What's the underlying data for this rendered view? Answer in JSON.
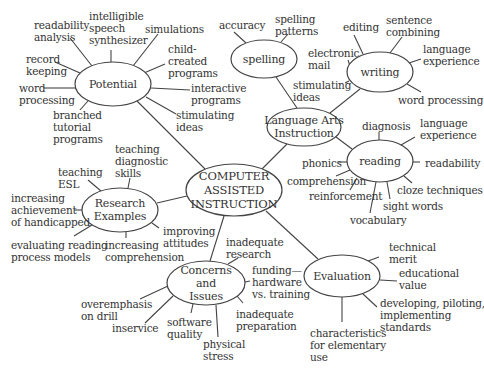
{
  "diagram": {
    "stroke_color": "#444444",
    "text_color": "#333333",
    "center": {
      "label": "COMPUTER\nASSISTED\nINSTRUCTION",
      "cx": 234,
      "cy": 190,
      "rx": 48,
      "ry": 26
    },
    "nodes": [
      {
        "id": "potential",
        "label": "Potential",
        "cx": 113,
        "cy": 84,
        "rx": 38,
        "ry": 22
      },
      {
        "id": "spelling",
        "label": "spelling",
        "cx": 264,
        "cy": 59,
        "rx": 33,
        "ry": 19
      },
      {
        "id": "writing",
        "label": "writing",
        "cx": 380,
        "cy": 72,
        "rx": 33,
        "ry": 20
      },
      {
        "id": "language-arts",
        "label": "Language Arts\nInstruction",
        "cx": 304,
        "cy": 127,
        "rx": 37,
        "ry": 19
      },
      {
        "id": "reading",
        "label": "reading",
        "cx": 380,
        "cy": 161,
        "rx": 33,
        "ry": 21
      },
      {
        "id": "research",
        "label": "Research\nExamples",
        "cx": 120,
        "cy": 210,
        "rx": 38,
        "ry": 22
      },
      {
        "id": "concerns",
        "label": "Concerns\nand\nIssues",
        "cx": 206,
        "cy": 283,
        "rx": 39,
        "ry": 22
      },
      {
        "id": "evaluation",
        "label": "Evaluation",
        "cx": 342,
        "cy": 276,
        "rx": 38,
        "ry": 21
      }
    ],
    "connectors": [
      {
        "from": "center",
        "to": "potential",
        "x1": 205,
        "y1": 169,
        "x2": 137,
        "y2": 101
      },
      {
        "from": "center",
        "to": "language-arts",
        "x1": 262,
        "y1": 169,
        "x2": 287,
        "y2": 144
      },
      {
        "from": "language-arts",
        "to": "spelling",
        "x1": 297,
        "y1": 108,
        "x2": 276,
        "y2": 77
      },
      {
        "from": "language-arts",
        "to": "writing",
        "x1": 330,
        "y1": 113,
        "x2": 360,
        "y2": 89
      },
      {
        "from": "language-arts",
        "to": "reading",
        "x1": 336,
        "y1": 137,
        "x2": 352,
        "y2": 149
      },
      {
        "from": "center",
        "to": "research",
        "x1": 187,
        "y1": 196,
        "x2": 157,
        "y2": 203
      },
      {
        "from": "center",
        "to": "concerns",
        "x1": 224,
        "y1": 216,
        "x2": 210,
        "y2": 261
      },
      {
        "from": "center",
        "to": "evaluation",
        "x1": 266,
        "y1": 211,
        "x2": 318,
        "y2": 259
      }
    ],
    "spokes": [
      {
        "x1": 92,
        "y1": 66,
        "x2": 70,
        "y2": 38
      },
      {
        "x1": 111,
        "y1": 62,
        "x2": 111,
        "y2": 50
      },
      {
        "x1": 133,
        "y1": 66,
        "x2": 158,
        "y2": 34
      },
      {
        "x1": 144,
        "y1": 73,
        "x2": 165,
        "y2": 64
      },
      {
        "x1": 151,
        "y1": 88,
        "x2": 190,
        "y2": 90
      },
      {
        "x1": 146,
        "y1": 97,
        "x2": 176,
        "y2": 114
      },
      {
        "x1": 80,
        "y1": 73,
        "x2": 55,
        "y2": 62
      },
      {
        "x1": 76,
        "y1": 88,
        "x2": 44,
        "y2": 88
      },
      {
        "x1": 88,
        "y1": 101,
        "x2": 80,
        "y2": 110
      },
      {
        "x1": 246,
        "y1": 43,
        "x2": 234,
        "y2": 32
      },
      {
        "x1": 281,
        "y1": 42,
        "x2": 288,
        "y2": 34
      },
      {
        "x1": 363,
        "y1": 54,
        "x2": 354,
        "y2": 35
      },
      {
        "x1": 390,
        "y1": 53,
        "x2": 402,
        "y2": 37
      },
      {
        "x1": 409,
        "y1": 63,
        "x2": 421,
        "y2": 59
      },
      {
        "x1": 407,
        "y1": 84,
        "x2": 421,
        "y2": 92
      },
      {
        "x1": 350,
        "y1": 66,
        "x2": 348,
        "y2": 60
      },
      {
        "x1": 349,
        "y1": 81,
        "x2": 345,
        "y2": 83
      },
      {
        "x1": 379,
        "y1": 140,
        "x2": 379,
        "y2": 132
      },
      {
        "x1": 401,
        "y1": 145,
        "x2": 415,
        "y2": 137
      },
      {
        "x1": 413,
        "y1": 162,
        "x2": 420,
        "y2": 162
      },
      {
        "x1": 404,
        "y1": 176,
        "x2": 412,
        "y2": 183
      },
      {
        "x1": 347,
        "y1": 162,
        "x2": 338,
        "y2": 162
      },
      {
        "x1": 350,
        "y1": 170,
        "x2": 336,
        "y2": 176
      },
      {
        "x1": 357,
        "y1": 178,
        "x2": 350,
        "y2": 190
      },
      {
        "x1": 376,
        "y1": 182,
        "x2": 370,
        "y2": 213
      },
      {
        "x1": 387,
        "y1": 182,
        "x2": 390,
        "y2": 199
      },
      {
        "x1": 101,
        "y1": 191,
        "x2": 88,
        "y2": 180
      },
      {
        "x1": 128,
        "y1": 188,
        "x2": 130,
        "y2": 178
      },
      {
        "x1": 82,
        "y1": 210,
        "x2": 74,
        "y2": 210
      },
      {
        "x1": 92,
        "y1": 225,
        "x2": 74,
        "y2": 236
      },
      {
        "x1": 126,
        "y1": 232,
        "x2": 126,
        "y2": 238
      },
      {
        "x1": 152,
        "y1": 223,
        "x2": 159,
        "y2": 228
      },
      {
        "x1": 228,
        "y1": 264,
        "x2": 238,
        "y2": 258
      },
      {
        "x1": 245,
        "y1": 282,
        "x2": 250,
        "y2": 281
      },
      {
        "x1": 237,
        "y1": 296,
        "x2": 243,
        "y2": 303
      },
      {
        "x1": 168,
        "y1": 286,
        "x2": 140,
        "y2": 299
      },
      {
        "x1": 173,
        "y1": 296,
        "x2": 145,
        "y2": 323
      },
      {
        "x1": 193,
        "y1": 304,
        "x2": 191,
        "y2": 313
      },
      {
        "x1": 216,
        "y1": 305,
        "x2": 218,
        "y2": 337
      },
      {
        "x1": 368,
        "y1": 261,
        "x2": 379,
        "y2": 257
      },
      {
        "x1": 380,
        "y1": 280,
        "x2": 397,
        "y2": 281
      },
      {
        "x1": 363,
        "y1": 294,
        "x2": 377,
        "y2": 307
      },
      {
        "x1": 342,
        "y1": 297,
        "x2": 342,
        "y2": 322
      }
    ],
    "leaf_labels": [
      {
        "node": "potential",
        "text": "readability\nanalysis",
        "x": 34,
        "y": 19
      },
      {
        "node": "potential",
        "text": "intelligible\nspeech\nsynthesizer",
        "x": 89,
        "y": 10
      },
      {
        "node": "potential",
        "text": "simulations",
        "x": 145,
        "y": 23
      },
      {
        "node": "potential",
        "text": "child-\ncreated\nprograms",
        "x": 168,
        "y": 43
      },
      {
        "node": "potential",
        "text": "record\nkeeping",
        "x": 26,
        "y": 53
      },
      {
        "node": "potential",
        "text": "word\nprocessing",
        "x": 19,
        "y": 82
      },
      {
        "node": "potential",
        "text": "interactive\nprograms",
        "x": 191,
        "y": 82
      },
      {
        "node": "potential",
        "text": "branched\ntutorial\nprograms",
        "x": 53,
        "y": 109
      },
      {
        "node": "potential",
        "text": "stimulating\nideas",
        "x": 176,
        "y": 109
      },
      {
        "node": "spelling",
        "text": "accuracy",
        "x": 219,
        "y": 19
      },
      {
        "node": "spelling",
        "text": "spelling\npatterns",
        "x": 275,
        "y": 13
      },
      {
        "node": "writing",
        "text": "editing",
        "x": 343,
        "y": 21
      },
      {
        "node": "writing",
        "text": "sentence\ncombining",
        "x": 386,
        "y": 14
      },
      {
        "node": "writing",
        "text": "language\nexperience",
        "x": 423,
        "y": 43
      },
      {
        "node": "writing",
        "text": "electronic\nmail",
        "x": 308,
        "y": 47
      },
      {
        "node": "writing",
        "text": "stimulating\nideas",
        "x": 293,
        "y": 79
      },
      {
        "node": "writing",
        "text": "word processing",
        "x": 398,
        "y": 94
      },
      {
        "node": "reading",
        "text": "diagnosis",
        "x": 362,
        "y": 120
      },
      {
        "node": "reading",
        "text": "language\nexperience",
        "x": 420,
        "y": 117
      },
      {
        "node": "reading",
        "text": "phonics",
        "x": 302,
        "y": 157
      },
      {
        "node": "reading",
        "text": "readability",
        "x": 425,
        "y": 157
      },
      {
        "node": "reading",
        "text": "comprehension",
        "x": 287,
        "y": 175
      },
      {
        "node": "reading",
        "text": "reinforcement",
        "x": 309,
        "y": 190
      },
      {
        "node": "reading",
        "text": "cloze techniques",
        "x": 397,
        "y": 184
      },
      {
        "node": "reading",
        "text": "sight words",
        "x": 383,
        "y": 200
      },
      {
        "node": "reading",
        "text": "vocabulary",
        "x": 350,
        "y": 214
      },
      {
        "node": "research",
        "text": "teaching\ndiagnostic\nskills",
        "x": 115,
        "y": 143
      },
      {
        "node": "research",
        "text": "teaching\nESL",
        "x": 58,
        "y": 166
      },
      {
        "node": "research",
        "text": "increasing\nachievement\nof handicapped",
        "x": 11,
        "y": 192
      },
      {
        "node": "research",
        "text": "improving\nattitudes",
        "x": 163,
        "y": 225
      },
      {
        "node": "research",
        "text": "evaluating reading\nprocess models",
        "x": 11,
        "y": 239
      },
      {
        "node": "research",
        "text": "increasing\ncomprehension",
        "x": 105,
        "y": 239
      },
      {
        "node": "concerns",
        "text": "inadequate\nresearch",
        "x": 226,
        "y": 236
      },
      {
        "node": "concerns",
        "text": "funding—\nhardware\nvs. training",
        "x": 252,
        "y": 264
      },
      {
        "node": "concerns",
        "text": "overemphasis\non drill",
        "x": 81,
        "y": 298
      },
      {
        "node": "concerns",
        "text": "inadequate\npreparation",
        "x": 236,
        "y": 308
      },
      {
        "node": "concerns",
        "text": "inservice",
        "x": 112,
        "y": 322
      },
      {
        "node": "concerns",
        "text": "software\nquality",
        "x": 167,
        "y": 316
      },
      {
        "node": "concerns",
        "text": "physical\nstress",
        "x": 203,
        "y": 338
      },
      {
        "node": "evaluation",
        "text": "technical\nmerit",
        "x": 389,
        "y": 241
      },
      {
        "node": "evaluation",
        "text": "educational\nvalue",
        "x": 399,
        "y": 267
      },
      {
        "node": "evaluation",
        "text": "developing, piloting,\nimplementing\nstandards",
        "x": 380,
        "y": 297
      },
      {
        "node": "evaluation",
        "text": "characteristics\nfor elementary\nuse",
        "x": 310,
        "y": 327
      }
    ]
  }
}
